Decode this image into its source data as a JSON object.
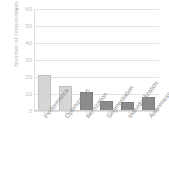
{
  "chart_data": {
    "type": "bar",
    "title": "",
    "subtitle": "",
    "xlabel": "",
    "ylabel": "Number of respondents",
    "categories": [
      "Performance",
      "Optimization",
      "Itemization",
      "Segmentation",
      "Individualization",
      "Awareness"
    ],
    "values": [
      21,
      15,
      11,
      6,
      5.5,
      8
    ],
    "ylim": [
      0,
      60
    ],
    "yticks": [
      0,
      10,
      20,
      30,
      40,
      50,
      60
    ],
    "ytick_labels": [
      "0",
      "10",
      "20",
      "30",
      "40",
      "50",
      "60"
    ],
    "grid": true,
    "legend": "none",
    "bar_colors": [
      "#d6d6d6",
      "#d6d6d6",
      "#8b8b8b",
      "#8b8b8b",
      "#8b8b8b",
      "#8b8b8b"
    ],
    "colors": {
      "light_bar": "#d6d6d6",
      "dark_bar": "#8b8b8b",
      "gridline": "#e3e3e3",
      "axis_line": "#cfcfcf",
      "tick_text": "#c2c2c2",
      "category_text": "#8f8f8f",
      "axis_title_text": "#b9b9b9",
      "background": "#ffffff"
    }
  },
  "axis": {
    "y_title": "Number of respondents",
    "y_title_marker_icon": "triangle-up-icon"
  }
}
